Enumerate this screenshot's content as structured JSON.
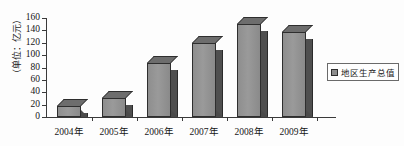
{
  "chart_data": {
    "type": "bar",
    "title": "",
    "subtitle": "",
    "xlabel": "",
    "ylabel": "（单位：亿元）",
    "categories": [
      "2004年",
      "2005年",
      "2006年",
      "2007年",
      "2008年",
      "2009年"
    ],
    "values": [
      18,
      30,
      88,
      120,
      150,
      137
    ],
    "series": [
      {
        "name": "地区生产总值",
        "values": [
          18,
          30,
          88,
          120,
          150,
          137
        ]
      }
    ],
    "ylim": [
      0,
      160
    ],
    "ytick_step": 20,
    "ytick_labels": [
      "0",
      "20",
      "40",
      "60",
      "80",
      "100",
      "120",
      "140",
      "160"
    ],
    "grid": false,
    "legend_position": "right",
    "legend_entries": [
      "地区生产总值"
    ],
    "annotations": [],
    "style": "3d-bar-grayscale"
  },
  "colors": {
    "bar_face": "#8e8e8e",
    "bar_side": "#4f4f4f",
    "bar_top": "#6d6d6d",
    "bar_outline": "#2e2e2e",
    "axis": "#3a3a3a",
    "text": "#151515",
    "background": "#fdfdfd",
    "legend_border": "#6a6a6a"
  },
  "legend": {
    "label": "地区生产总值"
  }
}
